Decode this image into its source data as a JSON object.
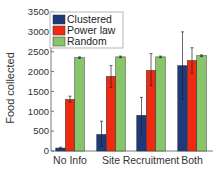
{
  "chart_data": {
    "type": "bar",
    "title": "",
    "xlabel": "",
    "ylabel": "Food collected",
    "ylim": [
      0,
      3500
    ],
    "yticks": [
      0,
      500,
      1000,
      1500,
      2000,
      2500,
      3000,
      3500
    ],
    "categories": [
      "No Info",
      "Site",
      "Recruitment",
      "Both"
    ],
    "legend_position": "upper left",
    "series": [
      {
        "name": "Clustered",
        "color": "#1f3a7a",
        "values": [
          75,
          420,
          900,
          2150
        ],
        "err_low": [
          55,
          120,
          420,
          1300
        ],
        "err_high": [
          95,
          750,
          1350,
          3000
        ]
      },
      {
        "name": "Power law",
        "color": "#ee2a10",
        "values": [
          1300,
          1880,
          2030,
          2280
        ],
        "err_low": [
          1230,
          1600,
          1650,
          1950
        ],
        "err_high": [
          1380,
          2150,
          2450,
          2600
        ]
      },
      {
        "name": "Random",
        "color": "#88c46a",
        "values": [
          2350,
          2370,
          2370,
          2400
        ],
        "err_low": [
          2330,
          2350,
          2350,
          2380
        ],
        "err_high": [
          2370,
          2390,
          2390,
          2420
        ]
      }
    ]
  }
}
